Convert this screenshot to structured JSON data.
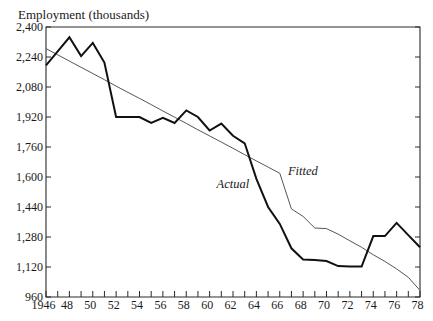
{
  "figure": {
    "y_axis_title": "Employment (thousands)",
    "annotation_actual": "Actual",
    "annotation_fitted": "Fitted"
  },
  "colors": {
    "background": "#ffffff",
    "ink": "#1a1a1a",
    "actual_line": "#111111",
    "fitted_line": "#555555"
  },
  "chart_data": {
    "type": "line",
    "title": "",
    "xlabel": "",
    "ylabel": "Employment (thousands)",
    "xlim": [
      1946,
      1978
    ],
    "ylim": [
      960,
      2400
    ],
    "grid": false,
    "legend": "inline labels (Actual, Fitted)",
    "x": [
      1946,
      1947,
      1948,
      1949,
      1950,
      1951,
      1952,
      1953,
      1954,
      1955,
      1956,
      1957,
      1958,
      1959,
      1960,
      1961,
      1962,
      1963,
      1964,
      1965,
      1966,
      1967,
      1968,
      1969,
      1970,
      1971,
      1972,
      1973,
      1974,
      1975,
      1976,
      1977,
      1978
    ],
    "series": [
      {
        "name": "Actual",
        "style": "thick",
        "values": [
          2195,
          2270,
          2345,
          2245,
          2315,
          2210,
          1920,
          1920,
          1920,
          1888,
          1915,
          1888,
          1955,
          1920,
          1848,
          1885,
          1820,
          1780,
          1590,
          1440,
          1350,
          1220,
          1160,
          1157,
          1152,
          1125,
          1122,
          1122,
          1285,
          1285,
          1355,
          1290,
          1225
        ]
      },
      {
        "name": "Fitted",
        "style": "thin",
        "values": [
          2285,
          2252,
          2218,
          2185,
          2152,
          2119,
          2085,
          2052,
          2019,
          1986,
          1952,
          1919,
          1886,
          1852,
          1819,
          1786,
          1753,
          1719,
          1686,
          1653,
          1620,
          1430,
          1390,
          1328,
          1325,
          1295,
          1260,
          1225,
          1185,
          1150,
          1110,
          1065,
          995
        ]
      }
    ],
    "yticks": [
      960,
      1120,
      1280,
      1440,
      1600,
      1760,
      1920,
      2080,
      2240,
      2400
    ],
    "ytick_labels": [
      "960",
      "1,120",
      "1,280",
      "1,440",
      "1,600",
      "1,760",
      "1,920",
      "2,080",
      "2,240",
      "2,400"
    ],
    "xticks": [
      1946,
      1948,
      1950,
      1952,
      1954,
      1956,
      1958,
      1960,
      1962,
      1964,
      1966,
      1968,
      1970,
      1972,
      1974,
      1976,
      1978
    ],
    "xtick_labels": [
      "1946",
      "48",
      "50",
      "52",
      "54",
      "56",
      "58",
      "60",
      "62",
      "64",
      "66",
      "68",
      "70",
      "72",
      "74",
      "76",
      "78"
    ],
    "minor_xticks_every": 1,
    "annotations": [
      {
        "text": "Actual",
        "x": 1960.6,
        "y": 1541
      },
      {
        "text": "Fitted",
        "x": 1966.7,
        "y": 1611
      }
    ]
  }
}
